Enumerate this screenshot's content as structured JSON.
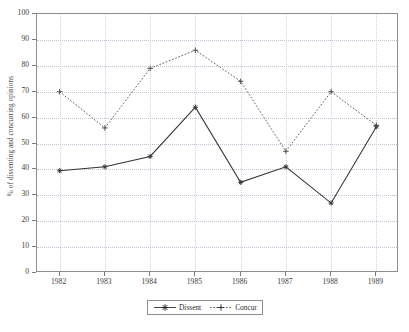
{
  "chart_data": {
    "type": "line",
    "title": "",
    "subtitle": "",
    "xlabel": "",
    "ylabel": "% of dissenting and concurring opinions",
    "categories": [
      "1982",
      "1983",
      "1984",
      "1985",
      "1986",
      "1987",
      "1988",
      "1989"
    ],
    "x": [
      1982,
      1983,
      1984,
      1985,
      1986,
      1987,
      1988,
      1989
    ],
    "xlim": [
      1981.5,
      1989.5
    ],
    "ylim": [
      0,
      100
    ],
    "yticks": [
      0,
      10,
      20,
      30,
      40,
      50,
      60,
      70,
      80,
      90,
      100
    ],
    "ytick_labels": [
      "0",
      "10",
      "20",
      "30",
      "40",
      "50",
      "60",
      "70",
      "80",
      "90",
      "100"
    ],
    "grid": true,
    "grid_style": "dotted",
    "legend_position": "bottom-center",
    "series": [
      {
        "name": "Dissent",
        "marker": "star",
        "linestyle": "solid",
        "color": "#333333",
        "values": [
          39.5,
          41,
          45,
          64,
          35,
          41,
          27,
          56.5
        ]
      },
      {
        "name": "Concur",
        "marker": "plus",
        "linestyle": "dotted",
        "color": "#444444",
        "values": [
          70,
          56,
          79,
          86,
          74,
          47,
          70,
          57
        ]
      }
    ],
    "annotations": []
  },
  "legend": {
    "entries": [
      {
        "label": "Dissent"
      },
      {
        "label": "Concur"
      }
    ]
  },
  "caption": {
    "text": ""
  },
  "colors": {
    "axis": "#8e8e8e",
    "grid": "#b9c6d6",
    "dissent": "#333333",
    "concur": "#444444",
    "text": "#3c3c3c"
  }
}
